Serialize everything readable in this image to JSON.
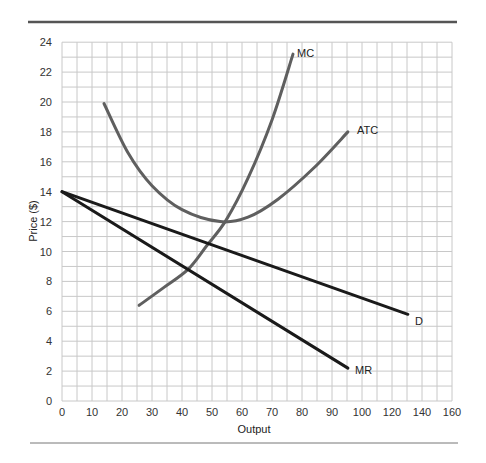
{
  "chart_data": {
    "type": "line",
    "title": "",
    "xlabel": "Output",
    "ylabel": "Price ($)",
    "xlim": [
      0,
      130
    ],
    "ylim": [
      0,
      24
    ],
    "grid": true,
    "x_tick_labels": [
      "0",
      "10",
      "20",
      "30",
      "40",
      "50",
      "60",
      "70",
      "80",
      "90",
      "100",
      "120",
      "140",
      "160"
    ],
    "y_tick_labels": [
      "0",
      "2",
      "4",
      "6",
      "8",
      "10",
      "12",
      "14",
      "16",
      "18",
      "20",
      "22",
      "24"
    ],
    "series": [
      {
        "name": "MC",
        "color": "#5f5f5f",
        "points": [
          [
            25.7,
            6.4
          ],
          [
            34,
            7.6
          ],
          [
            42,
            8.8
          ],
          [
            48.3,
            10.4
          ],
          [
            54.7,
            12.1
          ],
          [
            62,
            14.9
          ],
          [
            70,
            18.8
          ],
          [
            77,
            23.2
          ]
        ]
      },
      {
        "name": "ATC",
        "color": "#5f5f5f",
        "points": [
          [
            14,
            19.9
          ],
          [
            22,
            16.6
          ],
          [
            30,
            14.4
          ],
          [
            40,
            12.8
          ],
          [
            52.7,
            12.0
          ],
          [
            62,
            12.3
          ],
          [
            72,
            13.5
          ],
          [
            84,
            15.6
          ],
          [
            95.3,
            18.0
          ]
        ]
      },
      {
        "name": "D",
        "color": "#1a1a1a",
        "points": [
          [
            0,
            14
          ],
          [
            48.3,
            10.4
          ],
          [
            115.3,
            5.8
          ]
        ]
      },
      {
        "name": "MR",
        "color": "#1a1a1a",
        "points": [
          [
            0,
            14
          ],
          [
            42,
            8.8
          ],
          [
            95.3,
            2.2
          ]
        ]
      }
    ],
    "annotations": [
      {
        "text": "MC",
        "x": 79,
        "y": 23
      },
      {
        "text": "ATC",
        "x": 98,
        "y": 18
      },
      {
        "text": "D",
        "x": 118,
        "y": 5.3
      },
      {
        "text": "MR",
        "x": 98,
        "y": 2
      }
    ]
  },
  "labels": {
    "xlabel": "Output",
    "ylabel": "Price ($)",
    "mc": "MC",
    "atc": "ATC",
    "d": "D",
    "mr": "MR"
  }
}
